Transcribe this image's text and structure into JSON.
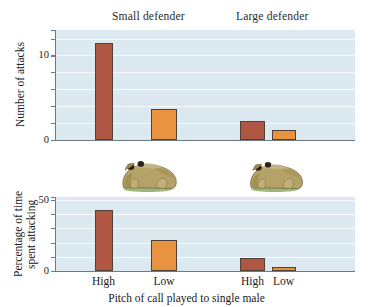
{
  "figure": {
    "group_headers": [
      "Small defender",
      "Large defender"
    ],
    "xtitle": "Pitch of call played to single male",
    "colors": {
      "bar_high": "#b05744",
      "bar_low": "#e8933f",
      "plot_background": "#dce9f0",
      "axis": "#6b7b83",
      "gridline": "#ffffff"
    },
    "illustrations": [
      {
        "name": "small-toad-illustration",
        "label": "toad"
      },
      {
        "name": "large-toad-illustration",
        "label": "toad"
      }
    ]
  },
  "chart_data": [
    {
      "type": "bar",
      "title": "",
      "ylabel": "Number of attacks",
      "xlabel": "",
      "ylim": [
        0,
        13
      ],
      "yticks": [
        0,
        2,
        4,
        6,
        8,
        10,
        12
      ],
      "ytick_labels": [
        "0",
        "",
        "",
        "",
        "",
        "10",
        ""
      ],
      "grid": true,
      "categories": [
        "High",
        "Low",
        "High",
        "Low"
      ],
      "groups": [
        "Small defender",
        "Small defender",
        "Large defender",
        "Large defender"
      ],
      "values": [
        11.5,
        3.7,
        2.3,
        1.2
      ],
      "legend": null
    },
    {
      "type": "bar",
      "title": "",
      "ylabel": "Percentage of time spent attacking",
      "ylabel_lines": [
        "Percentage of time",
        "spent attacking"
      ],
      "xlabel": "Pitch of call played to single male",
      "ylim": [
        0,
        52
      ],
      "yticks": [
        0,
        10,
        20,
        30,
        40,
        50
      ],
      "ytick_labels": [
        "0",
        "",
        "",
        "",
        "",
        "50"
      ],
      "grid": true,
      "categories": [
        "High",
        "Low",
        "High",
        "Low"
      ],
      "groups": [
        "Small defender",
        "Small defender",
        "Large defender",
        "Large defender"
      ],
      "values": [
        43,
        22,
        9,
        3
      ],
      "legend": null
    }
  ]
}
